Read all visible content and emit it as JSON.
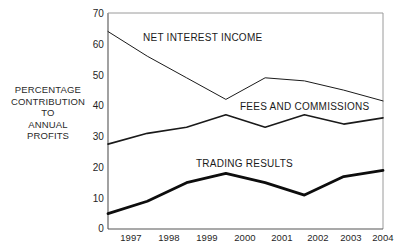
{
  "chart_data": {
    "type": "line",
    "title": "",
    "xlabel": "",
    "ylabel": "PERCENTAGE CONTRIBUTION TO ANNUAL PROFITS",
    "ylabel_lines": [
      "PERCENTAGE",
      "CONTRIBUTION",
      "TO",
      "ANNUAL",
      "PROFITS"
    ],
    "categories": [
      "1997",
      "1998",
      "1999",
      "2000",
      "2001",
      "2002",
      "2003",
      "2004"
    ],
    "x": [
      1997,
      1998,
      1999,
      2000,
      2001,
      2002,
      2003,
      2004
    ],
    "ylim": [
      0,
      70
    ],
    "yticks": [
      0,
      10,
      20,
      30,
      40,
      50,
      60,
      70
    ],
    "grid": false,
    "legend": "inline-annotations",
    "series": [
      {
        "name": "NET INTEREST INCOME",
        "values": [
          64,
          56,
          49,
          42,
          49,
          48,
          45,
          41.5
        ],
        "line_width": 1,
        "color": "#1a1a1a"
      },
      {
        "name": "FEES AND COMMISSIONS",
        "values": [
          27.5,
          31,
          33,
          37,
          33,
          37,
          34,
          36
        ],
        "line_width": 1.6,
        "color": "#1a1a1a"
      },
      {
        "name": "TRADING RESULTS",
        "values": [
          5,
          9,
          15,
          18,
          15,
          11,
          17,
          19
        ],
        "line_width": 2.8,
        "color": "#0d0d0d"
      }
    ],
    "annotations": [
      {
        "text": "NET INTEREST INCOME",
        "x_px": 143,
        "y_px": 32
      },
      {
        "text": "FEES AND COMMISSIONS",
        "x_px": 240,
        "y_px": 101
      },
      {
        "text": "TRADING RESULTS",
        "x_px": 196,
        "y_px": 158
      }
    ]
  },
  "axis": {
    "y_ticks": [
      "70",
      "60",
      "50",
      "40",
      "30",
      "20",
      "10",
      "0"
    ],
    "x_ticks": [
      "1997",
      "1998",
      "1999",
      "2000",
      "2001",
      "2002",
      "2003",
      "2004"
    ]
  }
}
